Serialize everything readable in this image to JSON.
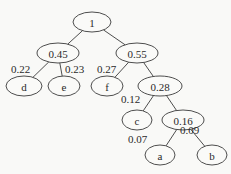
{
  "diagram": {
    "type": "huffman-tree",
    "nodes": [
      {
        "id": "root",
        "label": "1",
        "cx": 92,
        "cy": 22,
        "rx": 19,
        "ry": 10
      },
      {
        "id": "n045",
        "label": "0.45",
        "cx": 58,
        "cy": 53,
        "rx": 21,
        "ry": 10
      },
      {
        "id": "n055",
        "label": "0.55",
        "cx": 137,
        "cy": 53,
        "rx": 21,
        "ry": 10
      },
      {
        "id": "d",
        "label": "d",
        "cx": 24,
        "cy": 86,
        "rx": 18,
        "ry": 10
      },
      {
        "id": "e",
        "label": "e",
        "cx": 64,
        "cy": 86,
        "rx": 16,
        "ry": 10
      },
      {
        "id": "f",
        "label": "f",
        "cx": 107,
        "cy": 86,
        "rx": 16,
        "ry": 10
      },
      {
        "id": "n028",
        "label": "0.28",
        "cx": 160,
        "cy": 86,
        "rx": 22,
        "ry": 10
      },
      {
        "id": "c",
        "label": "c",
        "cx": 137,
        "cy": 120,
        "rx": 15,
        "ry": 10
      },
      {
        "id": "n016",
        "label": "0.16",
        "cx": 183,
        "cy": 120,
        "rx": 21,
        "ry": 10
      },
      {
        "id": "a",
        "label": "a",
        "cx": 160,
        "cy": 155,
        "rx": 15,
        "ry": 10
      },
      {
        "id": "b",
        "label": "b",
        "cx": 212,
        "cy": 155,
        "rx": 15,
        "ry": 10
      }
    ],
    "edges": [
      {
        "from": "root",
        "to": "n045"
      },
      {
        "from": "root",
        "to": "n055"
      },
      {
        "from": "n045",
        "to": "d"
      },
      {
        "from": "n045",
        "to": "e"
      },
      {
        "from": "n055",
        "to": "f"
      },
      {
        "from": "n055",
        "to": "n028"
      },
      {
        "from": "n028",
        "to": "c"
      },
      {
        "from": "n028",
        "to": "n016"
      },
      {
        "from": "n016",
        "to": "a"
      },
      {
        "from": "n016",
        "to": "b"
      }
    ],
    "weights": [
      {
        "for": "d",
        "label": "0.22",
        "x": 11,
        "y": 73
      },
      {
        "for": "e",
        "label": "0.23",
        "x": 65,
        "y": 73
      },
      {
        "for": "f",
        "label": "0.27",
        "x": 97,
        "y": 73
      },
      {
        "for": "c",
        "label": "0.12",
        "x": 121,
        "y": 103
      },
      {
        "for": "a",
        "label": "0.07",
        "x": 128,
        "y": 143
      },
      {
        "for": "b",
        "label": "0.09",
        "x": 180,
        "y": 134
      }
    ]
  }
}
